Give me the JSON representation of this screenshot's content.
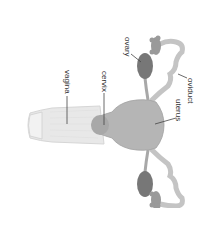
{
  "diagram": {
    "orientation": "rotated 90 degrees clockwise",
    "labels": {
      "ovary": "ovary",
      "oviduct": "oviduct",
      "uterus": "uterus",
      "cervix": "cervix",
      "vagina": "vagina"
    },
    "colors": {
      "background": "#ffffff",
      "uterus_fill": "#b3b3b3",
      "ovary_fill": "#7a7a7a",
      "oviduct_fill": "#c2c2c2",
      "vagina_fill": "#e6e6e6",
      "line": "#444444",
      "text": "#333333"
    }
  }
}
